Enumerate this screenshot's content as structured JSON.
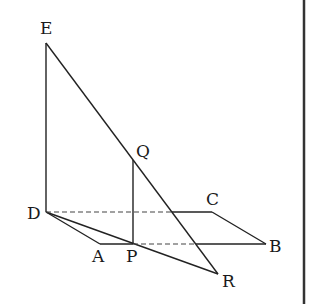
{
  "diagram": {
    "type": "3d-geometry",
    "colors": {
      "stroke": "#222222",
      "background": "#ffffff",
      "border": "#333333"
    },
    "points": {
      "E": {
        "label": "E",
        "x": 46,
        "y": 43,
        "lx": 40,
        "ly": 34
      },
      "D": {
        "label": "D",
        "x": 46,
        "y": 212,
        "lx": 27,
        "ly": 219
      },
      "A": {
        "label": "A",
        "x": 100,
        "y": 244,
        "lx": 92,
        "ly": 262
      },
      "P": {
        "label": "P",
        "x": 133,
        "y": 244,
        "lx": 126,
        "ly": 262
      },
      "B": {
        "label": "B",
        "x": 266,
        "y": 244,
        "lx": 269,
        "ly": 252
      },
      "C": {
        "label": "C",
        "x": 212,
        "y": 212,
        "lx": 206,
        "ly": 205
      },
      "Q": {
        "label": "Q",
        "x": 133,
        "y": 160,
        "lx": 136,
        "ly": 157
      },
      "R": {
        "label": "R",
        "x": 218,
        "y": 274,
        "lx": 222,
        "ly": 287
      }
    },
    "segments_solid": [
      "ED",
      "ER",
      "DA",
      "DR",
      "AP",
      "QP",
      "CB",
      "PB_solid_part",
      "DC_solid_part"
    ],
    "segments_dashed": [
      "DC",
      "PB"
    ]
  }
}
